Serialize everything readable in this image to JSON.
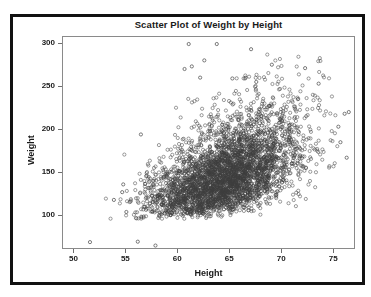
{
  "chart_data": {
    "type": "scatter",
    "title": "Scatter Plot of Weight by Height",
    "xlabel": "Height",
    "ylabel": "Weight",
    "xlim": [
      49.0,
      77.0
    ],
    "ylim": [
      62.0,
      307.0
    ],
    "xticks": [
      50,
      55,
      60,
      65,
      70,
      75
    ],
    "yticks": [
      100,
      150,
      200,
      250,
      300
    ],
    "grid": false,
    "legend": null,
    "n_points": 3800,
    "marker": {
      "shape": "open-circle",
      "size_px": 3.2,
      "edge_color": "#3d3d3d",
      "fill": "none",
      "line_width": 0.7,
      "opacity": 0.72
    },
    "distribution": {
      "model": "bivariate-normal-mixture",
      "x_mean": 64.6,
      "x_sd": 3.6,
      "y_mean": 152.0,
      "y_sd": 30.5,
      "correlation": 0.52,
      "y_skew": 0.55
    },
    "outliers": [
      {
        "x": 51.5,
        "y": 70.0
      },
      {
        "x": 56.1,
        "y": 70.5
      },
      {
        "x": 57.8,
        "y": 66.0
      },
      {
        "x": 53.8,
        "y": 119.0
      },
      {
        "x": 54.7,
        "y": 137.0
      },
      {
        "x": 54.6,
        "y": 128.0
      },
      {
        "x": 55.0,
        "y": 105.0
      },
      {
        "x": 56.4,
        "y": 195.0
      },
      {
        "x": 61.0,
        "y": 300.0
      },
      {
        "x": 63.7,
        "y": 300.0
      },
      {
        "x": 67.0,
        "y": 294.0
      },
      {
        "x": 62.5,
        "y": 281.0
      },
      {
        "x": 69.0,
        "y": 276.0
      },
      {
        "x": 72.2,
        "y": 272.0
      },
      {
        "x": 61.3,
        "y": 274.0
      },
      {
        "x": 60.6,
        "y": 271.0
      },
      {
        "x": 62.1,
        "y": 261.0
      },
      {
        "x": 65.2,
        "y": 260.0
      },
      {
        "x": 67.5,
        "y": 256.0
      },
      {
        "x": 73.5,
        "y": 254.0
      },
      {
        "x": 76.4,
        "y": 221.0
      },
      {
        "x": 76.0,
        "y": 219.0
      },
      {
        "x": 76.2,
        "y": 168.0
      },
      {
        "x": 75.6,
        "y": 186.0
      },
      {
        "x": 75.4,
        "y": 204.0
      }
    ],
    "x_axis_color": "#8a8a8a",
    "title_color": "#1a1a1a",
    "background": "#ffffff",
    "border_color": "#111111"
  },
  "figure": {
    "title": "Scatter Plot of Weight by Height",
    "xlabel": "Height",
    "ylabel": "Weight",
    "xtick_labels": [
      "50",
      "55",
      "60",
      "65",
      "70",
      "75"
    ],
    "ytick_labels": [
      "100",
      "150",
      "200",
      "250",
      "300"
    ]
  }
}
